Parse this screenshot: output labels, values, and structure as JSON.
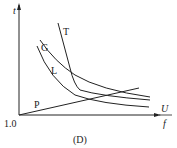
{
  "figure": {
    "caption": "(D)",
    "y_axis_label": "t",
    "x_axis_label_num": "U",
    "x_axis_label_den": "f",
    "origin_label": "1.0",
    "curves": [
      {
        "name": "T",
        "label": "T"
      },
      {
        "name": "G",
        "label": "G"
      },
      {
        "name": "L",
        "label": "L"
      },
      {
        "name": "P",
        "label": "P"
      }
    ]
  }
}
